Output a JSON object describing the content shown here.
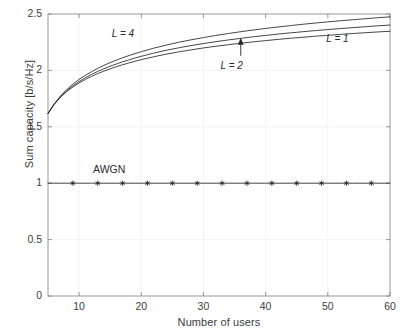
{
  "chart_data": {
    "type": "line",
    "title": "",
    "xlabel": "Number of users",
    "ylabel": "Sum capacity [b/s/Hz]",
    "xlim": [
      5,
      60
    ],
    "ylim": [
      0,
      2.5
    ],
    "xticks": [
      10,
      20,
      30,
      40,
      50,
      60
    ],
    "xtick_labels": [
      "10",
      "20",
      "30",
      "40",
      "50",
      "60"
    ],
    "yticks": [
      0,
      0.5,
      1,
      1.5,
      2,
      2.5
    ],
    "ytick_labels": [
      "0",
      "0.5",
      "1",
      "1.5",
      "2",
      "2.5"
    ],
    "grid": true,
    "legend": "none",
    "annotations": [
      {
        "text": "L = 4",
        "x": 17.5,
        "y": 2.31,
        "style": "italic"
      },
      {
        "text": "L = 2",
        "x": 35.0,
        "y": 2.03,
        "style": "italic",
        "arrow_to_y": 2.29
      },
      {
        "text": "L = 1",
        "x": 52.0,
        "y": 2.27,
        "style": "italic"
      },
      {
        "text": "AWGN",
        "x": 14.5,
        "y": 1.12,
        "style": "normal"
      }
    ],
    "x": [
      5,
      6,
      7,
      8,
      9,
      10,
      11,
      12,
      13,
      14,
      15,
      16,
      17,
      18,
      19,
      20,
      22,
      24,
      26,
      28,
      30,
      32,
      34,
      36,
      38,
      40,
      42,
      44,
      46,
      48,
      50,
      52,
      54,
      56,
      58,
      60
    ],
    "series": [
      {
        "name": "L = 4",
        "marker": "none",
        "values": [
          1.62,
          1.7,
          1.762,
          1.812,
          1.853,
          1.889,
          1.92,
          1.947,
          1.972,
          1.994,
          2.014,
          2.033,
          2.05,
          2.066,
          2.081,
          2.095,
          2.121,
          2.144,
          2.164,
          2.182,
          2.199,
          2.214,
          2.228,
          2.241,
          2.253,
          2.264,
          2.275,
          2.285,
          2.294,
          2.303,
          2.311,
          2.319,
          2.327,
          2.334,
          2.341,
          2.347
        ]
      },
      {
        "name": "L = 2",
        "marker": "none",
        "values": [
          1.618,
          1.701,
          1.766,
          1.819,
          1.863,
          1.901,
          1.935,
          1.964,
          1.991,
          2.015,
          2.037,
          2.057,
          2.076,
          2.093,
          2.11,
          2.125,
          2.153,
          2.178,
          2.2,
          2.22,
          2.238,
          2.255,
          2.27,
          2.284,
          2.298,
          2.31,
          2.322,
          2.333,
          2.343,
          2.353,
          2.362,
          2.371,
          2.379,
          2.387,
          2.395,
          2.402
        ]
      },
      {
        "name": "L = 1",
        "marker": "none",
        "values": [
          1.615,
          1.703,
          1.773,
          1.83,
          1.878,
          1.92,
          1.956,
          1.989,
          2.018,
          2.045,
          2.069,
          2.091,
          2.112,
          2.131,
          2.149,
          2.166,
          2.197,
          2.224,
          2.249,
          2.271,
          2.291,
          2.31,
          2.327,
          2.343,
          2.358,
          2.372,
          2.385,
          2.397,
          2.409,
          2.42,
          2.43,
          2.44,
          2.449,
          2.458,
          2.467,
          2.475
        ]
      },
      {
        "name": "AWGN",
        "marker": "asterisk",
        "marker_x": [
          9,
          13,
          17,
          21,
          25,
          29,
          33,
          37,
          41,
          45,
          49,
          53,
          57
        ],
        "constant": 1.0,
        "values": [
          1,
          1,
          1,
          1,
          1,
          1,
          1,
          1,
          1,
          1,
          1,
          1,
          1,
          1,
          1,
          1,
          1,
          1,
          1,
          1,
          1,
          1,
          1,
          1,
          1,
          1,
          1,
          1,
          1,
          1,
          1,
          1,
          1,
          1,
          1,
          1
        ]
      }
    ],
    "colors": {
      "line": "#262626",
      "axis": "#8c8c8c",
      "grid": "#f0f0f0",
      "text": "#3d3d3d",
      "background": "#ffffff"
    }
  }
}
